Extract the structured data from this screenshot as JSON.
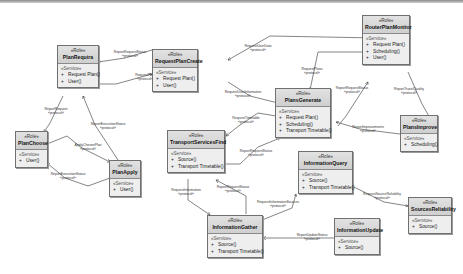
{
  "diagram": {
    "stereotype": "«Role»",
    "service_label": "«Service»",
    "roles": [
      {
        "id": "plan-requira",
        "name": "PlanRequira",
        "ops": [
          "Request Plan()",
          "User()"
        ]
      },
      {
        "id": "request-plan-create",
        "name": "RequestPlanCreate",
        "ops": [
          "Request Plan()",
          "User()"
        ]
      },
      {
        "id": "router-plan-monitor",
        "name": "RouterPlanMonitor",
        "ops": [
          "Request Plan()",
          "Scheduling()",
          "User()"
        ]
      },
      {
        "id": "plan-choose",
        "name": "PlanChoose",
        "ops": [
          "User()"
        ]
      },
      {
        "id": "plan-apply",
        "name": "PlanApply",
        "ops": [
          "User()"
        ]
      },
      {
        "id": "plans-generate",
        "name": "PlansGenerate",
        "ops": [
          "Request Plan()",
          "Scheduling()",
          "Transport Timetable()"
        ]
      },
      {
        "id": "plans-improve",
        "name": "PlansImprove",
        "ops": [
          "Scheduling()"
        ]
      },
      {
        "id": "transport-services-find",
        "name": "TransportServicesFind",
        "ops": [
          "Source()",
          "Transport Timetable()"
        ]
      },
      {
        "id": "information-query",
        "name": "InformationQuery",
        "ops": [
          "Source()",
          "Transport Timetable()"
        ]
      },
      {
        "id": "information-gather",
        "name": "InformationGather",
        "ops": [
          "Source()",
          "Transport Timetable()"
        ]
      },
      {
        "id": "information-update",
        "name": "InformationUpdate",
        "ops": [
          "Source()"
        ]
      },
      {
        "id": "sources-reliability",
        "name": "SourcesReliability",
        "ops": [
          "Source()"
        ]
      }
    ],
    "connections": [
      {
        "label": "ReportRequestStatus",
        "stereo": "«protocol»"
      },
      {
        "label": "RequestPlan",
        "stereo": "«protocol»"
      },
      {
        "label": "RequestUserData",
        "stereo": "«protocol»"
      },
      {
        "label": "RequestPlans",
        "stereo": "«protocol»"
      },
      {
        "label": "RequestUserInformation",
        "stereo": "«protocol»"
      },
      {
        "label": "ReportRequest",
        "stereo": "«protocol»"
      },
      {
        "label": "ReportExecutionStatus",
        "stereo": "«protocol»"
      },
      {
        "label": "ApplyChosenPlan",
        "stereo": "«protocol»"
      },
      {
        "label": "ReportExecutionStatus",
        "stereo": "«protocol»"
      },
      {
        "label": "ReportRequestStatus",
        "stereo": "«protocol»"
      },
      {
        "label": "ReportTravelQuality",
        "stereo": "«protocol»"
      },
      {
        "label": "RequestTimetable",
        "stereo": "«protocol»"
      },
      {
        "label": "ReportImprovements",
        "stereo": "«protocol»"
      },
      {
        "label": "ReportRequestStatus",
        "stereo": "«protocol»"
      },
      {
        "label": "RequestInformation",
        "stereo": "«protocol»"
      },
      {
        "label": "ReportRequestStatus",
        "stereo": "«protocol»"
      },
      {
        "label": "RequestInformationSources",
        "stereo": "«protocol»"
      },
      {
        "label": "RequestSourceReliability",
        "stereo": "«protocol»"
      },
      {
        "label": "ReportUpdateStatus",
        "stereo": "«protocol»"
      }
    ]
  }
}
